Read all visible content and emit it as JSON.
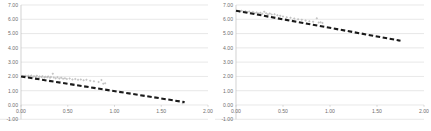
{
  "page": {
    "background": "#ffffff",
    "layout": "two scatter plots side by side"
  },
  "charts": [
    {
      "name": "left-chart",
      "title": "",
      "title_visible": false
    },
    {
      "name": "right-chart",
      "title": "",
      "title_visible": true,
      "title_note": "title is cropped off the top edge; only descender strokes visible"
    }
  ],
  "axis": {
    "y_ticks": [
      "7.00",
      "6.00",
      "5.00",
      "4.00",
      "3.00",
      "2.00",
      "1.00",
      "0.00",
      "-1.00"
    ],
    "x_ticks": [
      "0.00",
      "0.50",
      "1.00",
      "1.50",
      "2.00"
    ]
  },
  "colors": {
    "gridline": "#d9d9d9",
    "axis": "#bfbfbf",
    "tick_text": "#6f6f6f",
    "marker": "#b8b8b8",
    "trendline": "#1a1a1a",
    "title_text": "#2b2b2b"
  },
  "chart_data": [
    {
      "type": "scatter",
      "name": "left-chart",
      "title": "",
      "xlabel": "",
      "ylabel": "",
      "xlim": [
        0.0,
        2.0
      ],
      "ylim": [
        -1.0,
        7.0
      ],
      "grid": true,
      "legend": "none",
      "xticks": [
        0.0,
        0.5,
        1.0,
        1.5,
        2.0
      ],
      "yticks": [
        -1.0,
        0.0,
        1.0,
        2.0,
        3.0,
        4.0,
        5.0,
        6.0,
        7.0
      ],
      "series": [
        {
          "name": "observations",
          "marker": "diamond",
          "color": "#b8b8b8",
          "points": [
            [
              0.02,
              2.03
            ],
            [
              0.04,
              2.01
            ],
            [
              0.05,
              2.05
            ],
            [
              0.07,
              1.99
            ],
            [
              0.08,
              2.04
            ],
            [
              0.1,
              2.0
            ],
            [
              0.11,
              2.07
            ],
            [
              0.13,
              1.97
            ],
            [
              0.14,
              2.02
            ],
            [
              0.16,
              1.98
            ],
            [
              0.17,
              2.05
            ],
            [
              0.19,
              1.95
            ],
            [
              0.2,
              2.0
            ],
            [
              0.22,
              1.96
            ],
            [
              0.23,
              2.02
            ],
            [
              0.25,
              1.93
            ],
            [
              0.26,
              1.98
            ],
            [
              0.28,
              1.94
            ],
            [
              0.29,
              2.0
            ],
            [
              0.31,
              1.91
            ],
            [
              0.32,
              1.96
            ],
            [
              0.34,
              2.18
            ],
            [
              0.35,
              1.92
            ],
            [
              0.37,
              1.88
            ],
            [
              0.39,
              1.94
            ],
            [
              0.41,
              1.86
            ],
            [
              0.43,
              1.9
            ],
            [
              0.45,
              1.84
            ],
            [
              0.47,
              1.88
            ],
            [
              0.49,
              1.82
            ],
            [
              0.52,
              1.85
            ],
            [
              0.55,
              1.79
            ],
            [
              0.58,
              1.82
            ],
            [
              0.61,
              1.76
            ],
            [
              0.64,
              1.79
            ],
            [
              0.67,
              1.73
            ],
            [
              0.7,
              1.76
            ],
            [
              0.74,
              1.7
            ],
            [
              0.78,
              1.66
            ],
            [
              0.83,
              1.61
            ],
            [
              0.86,
              1.75
            ],
            [
              0.88,
              1.48
            ],
            [
              0.9,
              1.52
            ],
            [
              1.73,
              0.12
            ]
          ]
        }
      ],
      "trendline": {
        "type": "linear",
        "style": "dashed",
        "color": "#1a1a1a",
        "x_start": 0.0,
        "y_start": 2.0,
        "x_end": 1.75,
        "y_end": 0.2,
        "slope": -1.03,
        "intercept": 2.0
      }
    },
    {
      "type": "scatter",
      "name": "right-chart",
      "title": "",
      "xlabel": "",
      "ylabel": "",
      "xlim": [
        0.0,
        2.0
      ],
      "ylim": [
        -1.0,
        7.0
      ],
      "grid": true,
      "legend": "none",
      "xticks": [
        0.0,
        0.5,
        1.0,
        1.5,
        2.0
      ],
      "yticks": [
        -1.0,
        0.0,
        1.0,
        2.0,
        3.0,
        4.0,
        5.0,
        6.0,
        7.0
      ],
      "series": [
        {
          "name": "observations",
          "marker": "diamond",
          "color": "#b8b8b8",
          "points": [
            [
              0.02,
              6.58
            ],
            [
              0.04,
              6.55
            ],
            [
              0.06,
              6.6
            ],
            [
              0.08,
              6.52
            ],
            [
              0.1,
              6.57
            ],
            [
              0.12,
              6.49
            ],
            [
              0.14,
              6.54
            ],
            [
              0.16,
              6.46
            ],
            [
              0.18,
              6.51
            ],
            [
              0.2,
              6.44
            ],
            [
              0.22,
              6.48
            ],
            [
              0.24,
              6.41
            ],
            [
              0.26,
              6.46
            ],
            [
              0.28,
              6.38
            ],
            [
              0.3,
              6.52
            ],
            [
              0.32,
              6.43
            ],
            [
              0.34,
              6.36
            ],
            [
              0.36,
              6.4
            ],
            [
              0.38,
              6.33
            ],
            [
              0.41,
              6.36
            ],
            [
              0.44,
              6.28
            ],
            [
              0.47,
              6.24
            ],
            [
              0.5,
              6.19
            ],
            [
              0.54,
              6.14
            ],
            [
              0.58,
              6.1
            ],
            [
              0.62,
              6.06
            ],
            [
              0.66,
              6.01
            ],
            [
              0.7,
              5.96
            ],
            [
              0.74,
              5.92
            ],
            [
              0.78,
              5.87
            ],
            [
              0.82,
              5.83
            ],
            [
              0.86,
              6.08
            ],
            [
              0.88,
              5.78
            ],
            [
              0.9,
              5.8
            ],
            [
              0.92,
              5.74
            ],
            [
              1.73,
              4.52
            ]
          ]
        }
      ],
      "trendline": {
        "type": "linear",
        "style": "dashed",
        "color": "#1a1a1a",
        "x_start": 0.0,
        "y_start": 6.6,
        "x_end": 1.75,
        "y_end": 4.5,
        "slope": -1.2,
        "intercept": 6.6
      }
    }
  ]
}
